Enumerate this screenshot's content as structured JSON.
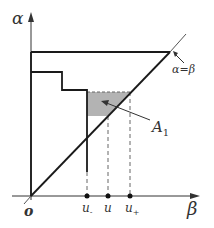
{
  "diagram": {
    "axes": {
      "y_label": "α",
      "x_label": "β",
      "origin_label": "o"
    },
    "diagonal_label": "α=β",
    "region_label_main": "A",
    "region_label_sub": "1",
    "ticks": [
      {
        "main": "u",
        "sub": "-"
      },
      {
        "main": "u",
        "sub": ""
      },
      {
        "main": "u",
        "sub": "+"
      }
    ],
    "colors": {
      "line": "#1a1a1a",
      "shade": "#b0b0b0",
      "dashed": "#555555",
      "text": "#333333"
    }
  }
}
